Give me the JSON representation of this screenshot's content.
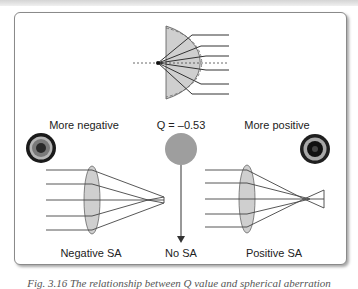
{
  "figure": {
    "labels": {
      "more_negative": "More negative",
      "q_value": "Q = –0.53",
      "more_positive": "More positive",
      "negative_sa": "Negative SA",
      "no_sa": "No SA",
      "positive_sa": "Positive SA"
    },
    "caption": "Fig. 3.16 The relationship between Q value and spherical aberration",
    "colors": {
      "lens_fill": "#c8c8c8",
      "line": "#3a3a3a",
      "spot_gray": "#9e9e9e",
      "ring_dark": "#1a1a1a"
    }
  }
}
